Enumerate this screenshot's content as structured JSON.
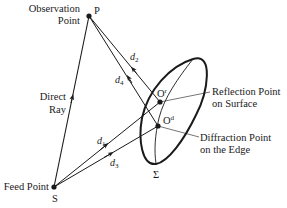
{
  "diagram": {
    "type": "reflector-antenna-ray-geometry",
    "points": {
      "P": {
        "label": "P",
        "desc_line1": "Observation",
        "desc_line2": "Point"
      },
      "S": {
        "label": "S",
        "desc": "Feed Point"
      },
      "O_r": {
        "label": "O",
        "sup": "r",
        "desc_line1": "Reflection Point",
        "desc_line2": "on Surface"
      },
      "O_d": {
        "label": "O",
        "sup": "d",
        "desc_line1": "Diffraction Point",
        "desc_line2": "on the Edge"
      }
    },
    "surface": {
      "label": "Σ"
    },
    "rays": {
      "direct": {
        "line1": "Direct",
        "line2": "Ray"
      },
      "d1": {
        "base": "d",
        "sub": "1"
      },
      "d2": {
        "base": "d",
        "sub": "2"
      },
      "d3": {
        "base": "d",
        "sub": "3"
      },
      "d4": {
        "base": "d",
        "sub": "4"
      }
    },
    "colors": {
      "stroke": "#1a1a1a",
      "background": "#ffffff"
    }
  }
}
